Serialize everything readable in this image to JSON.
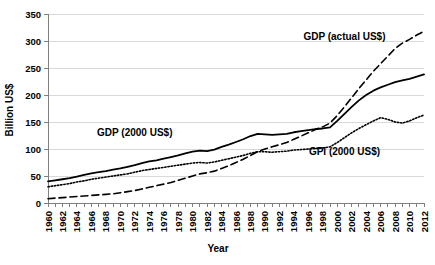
{
  "chart_data": {
    "type": "line",
    "title": "",
    "xlabel": "Year",
    "ylabel": "Billion US$",
    "xlim": [
      1960,
      2012
    ],
    "ylim": [
      0,
      350
    ],
    "yticks": [
      0,
      50,
      100,
      150,
      200,
      250,
      300,
      350
    ],
    "xticks": [
      1960,
      1962,
      1964,
      1966,
      1968,
      1970,
      1972,
      1974,
      1976,
      1978,
      1980,
      1982,
      1984,
      1986,
      1988,
      1990,
      1992,
      1994,
      1996,
      1998,
      2000,
      2002,
      2004,
      2006,
      2008,
      2010,
      2012
    ],
    "grid": "horizontal",
    "legend_position": "inline-annotations",
    "x": [
      1960,
      1961,
      1962,
      1963,
      1964,
      1965,
      1966,
      1967,
      1968,
      1969,
      1970,
      1971,
      1972,
      1973,
      1974,
      1975,
      1976,
      1977,
      1978,
      1979,
      1980,
      1981,
      1982,
      1983,
      1984,
      1985,
      1986,
      1987,
      1988,
      1989,
      1990,
      1991,
      1992,
      1993,
      1994,
      1995,
      1996,
      1997,
      1998,
      1999,
      2000,
      2001,
      2002,
      2003,
      2004,
      2005,
      2006,
      2007,
      2008,
      2009,
      2010,
      2011,
      2012
    ],
    "series": [
      {
        "name": "GDP (2000 US$)",
        "style": "solid",
        "color": "#000000",
        "annotation_x": 1972,
        "annotation_y": 125,
        "values": [
          40,
          42,
          44,
          46,
          49,
          52,
          55,
          57,
          59,
          62,
          64,
          67,
          70,
          74,
          77,
          79,
          82,
          85,
          88,
          92,
          95,
          97,
          96,
          99,
          104,
          108,
          113,
          118,
          124,
          128,
          127,
          126,
          127,
          128,
          131,
          133,
          135,
          137,
          138,
          140,
          152,
          165,
          178,
          190,
          200,
          208,
          214,
          219,
          224,
          227,
          230,
          234,
          238
        ]
      },
      {
        "name": "GPI (2000 US$)",
        "style": "dotted",
        "color": "#000000",
        "annotation_x": 2001,
        "annotation_y": 88,
        "values": [
          30,
          32,
          34,
          36,
          39,
          41,
          44,
          46,
          48,
          50,
          52,
          54,
          57,
          60,
          62,
          64,
          66,
          68,
          70,
          72,
          74,
          75,
          74,
          76,
          79,
          82,
          85,
          88,
          92,
          95,
          95,
          94,
          95,
          96,
          98,
          99,
          100,
          101,
          102,
          104,
          112,
          121,
          130,
          138,
          145,
          152,
          158,
          155,
          150,
          148,
          152,
          158,
          163
        ]
      },
      {
        "name": "GDP (actual US$)",
        "style": "dashed",
        "color": "#000000",
        "annotation_x": 2001,
        "annotation_y": 302,
        "values": [
          8,
          9,
          10,
          11,
          12,
          13,
          14,
          15,
          16,
          17,
          19,
          21,
          23,
          26,
          29,
          32,
          35,
          38,
          42,
          46,
          50,
          54,
          56,
          59,
          64,
          69,
          75,
          81,
          88,
          95,
          100,
          104,
          108,
          112,
          118,
          124,
          130,
          136,
          141,
          148,
          162,
          178,
          195,
          212,
          228,
          244,
          258,
          272,
          286,
          296,
          303,
          311,
          318
        ]
      }
    ]
  },
  "axes": {
    "y_title": "Billion US$",
    "x_title": "Year"
  }
}
